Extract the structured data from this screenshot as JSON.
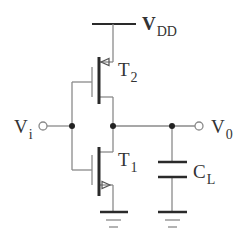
{
  "diagram": {
    "type": "CMOS inverter schematic",
    "supply": {
      "label_main": "V",
      "label_sub": "DD"
    },
    "input": {
      "label_main": "V",
      "label_sub": "i"
    },
    "output": {
      "label_main": "V",
      "label_sub": "0"
    },
    "transistors": [
      {
        "id": "T2",
        "label_main": "T",
        "label_sub": "2",
        "kind": "pmos-upper"
      },
      {
        "id": "T1",
        "label_main": "T",
        "label_sub": "1",
        "kind": "nmos-lower"
      }
    ],
    "load_capacitor": {
      "label_main": "C",
      "label_sub": "L"
    },
    "grounds": 2,
    "colors": {
      "wire": "#8a8a8a",
      "thick": "#2a2a2a",
      "text": "#333333",
      "background": "#ffffff"
    }
  }
}
